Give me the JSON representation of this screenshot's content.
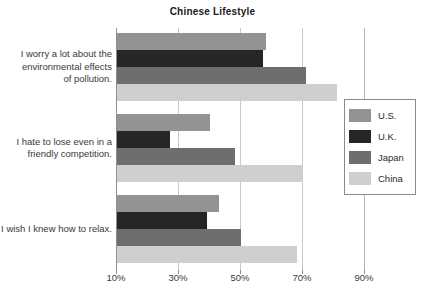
{
  "chart_data": {
    "type": "bar",
    "orientation": "horizontal",
    "title": "Chinese Lifestyle",
    "xlabel": "",
    "ylabel": "",
    "xlim": [
      10,
      90
    ],
    "xticks": [
      10,
      30,
      50,
      70,
      90
    ],
    "xtick_labels": [
      "10%",
      "30%",
      "50%",
      "70%",
      "90%"
    ],
    "grid": true,
    "legend_position": "right",
    "categories": [
      "I worry a lot about the environmental effects of pollution.",
      "I hate to lose even in a friendly competition.",
      "I wish I knew how to relax."
    ],
    "category_lines": [
      [
        "I worry a lot about the",
        "environmental effects",
        "of pollution."
      ],
      [
        "I hate to lose even in a",
        "friendly competition."
      ],
      [
        "I wish I knew how to relax."
      ]
    ],
    "series": [
      {
        "name": "U.S.",
        "color": "#939393",
        "values": [
          58,
          40,
          43
        ]
      },
      {
        "name": "U.K.",
        "color": "#262626",
        "values": [
          57,
          27,
          39
        ]
      },
      {
        "name": "Japan",
        "color": "#6e6e6e",
        "values": [
          71,
          48,
          50
        ]
      },
      {
        "name": "China",
        "color": "#cfcfcf",
        "values": [
          81,
          70,
          68
        ]
      }
    ]
  },
  "legend": {
    "entries": [
      {
        "label": "U.S.",
        "color": "#939393"
      },
      {
        "label": "U.K.",
        "color": "#262626"
      },
      {
        "label": "Japan",
        "color": "#6e6e6e"
      },
      {
        "label": "China",
        "color": "#cfcfcf"
      }
    ]
  }
}
